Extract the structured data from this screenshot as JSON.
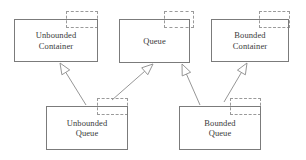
{
  "diagram": {
    "type": "uml-component-diagram",
    "canvas": {
      "width": 306,
      "height": 160,
      "background": "#ffffff"
    },
    "style": {
      "box_stroke": "#7b7b7b",
      "tab_stroke": "#9a9a9a",
      "edge_stroke": "#8a8a8a",
      "text_color": "#3a3a3a",
      "arrow_fill": "#ffffff"
    },
    "nodes": [
      {
        "id": "unbounded-container",
        "label": "Unbounded\nContainer",
        "line1": "Unbounded",
        "line2": "Container",
        "box": {
          "x": 14,
          "y": 19,
          "w": 84,
          "h": 43
        },
        "tab": {
          "x": 66,
          "y": 11,
          "w": 32,
          "h": 17
        }
      },
      {
        "id": "queue",
        "label": "Queue",
        "line1": "Queue",
        "line2": "",
        "box": {
          "x": 119,
          "y": 19,
          "w": 71,
          "h": 44
        },
        "tab": {
          "x": 164,
          "y": 11,
          "w": 30,
          "h": 17
        }
      },
      {
        "id": "bounded-container",
        "label": "Bounded\nContainer",
        "line1": "Bounded",
        "line2": "Container",
        "box": {
          "x": 211,
          "y": 19,
          "w": 78,
          "h": 43
        },
        "tab": {
          "x": 259,
          "y": 11,
          "w": 31,
          "h": 17
        }
      },
      {
        "id": "unbounded-queue",
        "label": "Unbounded\nQueue",
        "line1": "Unbounded",
        "line2": "Queue",
        "box": {
          "x": 46,
          "y": 106,
          "w": 82,
          "h": 44
        },
        "tab": {
          "x": 97,
          "y": 98,
          "w": 31,
          "h": 17
        }
      },
      {
        "id": "bounded-queue",
        "label": "Bounded\nQueue",
        "line1": "Bounded",
        "line2": "Queue",
        "box": {
          "x": 179,
          "y": 106,
          "w": 82,
          "h": 44
        },
        "tab": {
          "x": 230,
          "y": 98,
          "w": 31,
          "h": 17
        }
      }
    ],
    "edges": [
      {
        "id": "unbounded-queue-to-unbounded-container",
        "from": "unbounded-queue",
        "to": "unbounded-container",
        "relation": "generalization",
        "arrowhead": "hollow-triangle",
        "tip": {
          "x": 60,
          "y": 63
        },
        "tail": {
          "x": 86,
          "y": 105
        }
      },
      {
        "id": "unbounded-queue-to-queue",
        "from": "unbounded-queue",
        "to": "queue",
        "relation": "generalization",
        "arrowhead": "hollow-triangle",
        "tip": {
          "x": 153,
          "y": 64
        },
        "tail": {
          "x": 112,
          "y": 100
        }
      },
      {
        "id": "bounded-queue-to-queue",
        "from": "bounded-queue",
        "to": "queue",
        "relation": "generalization",
        "arrowhead": "hollow-triangle",
        "tip": {
          "x": 182,
          "y": 64
        },
        "tail": {
          "x": 200,
          "y": 105
        }
      },
      {
        "id": "bounded-queue-to-bounded-container",
        "from": "bounded-queue",
        "to": "bounded-container",
        "relation": "generalization",
        "arrowhead": "hollow-triangle",
        "tip": {
          "x": 247,
          "y": 63
        },
        "tail": {
          "x": 224,
          "y": 102
        }
      }
    ]
  }
}
